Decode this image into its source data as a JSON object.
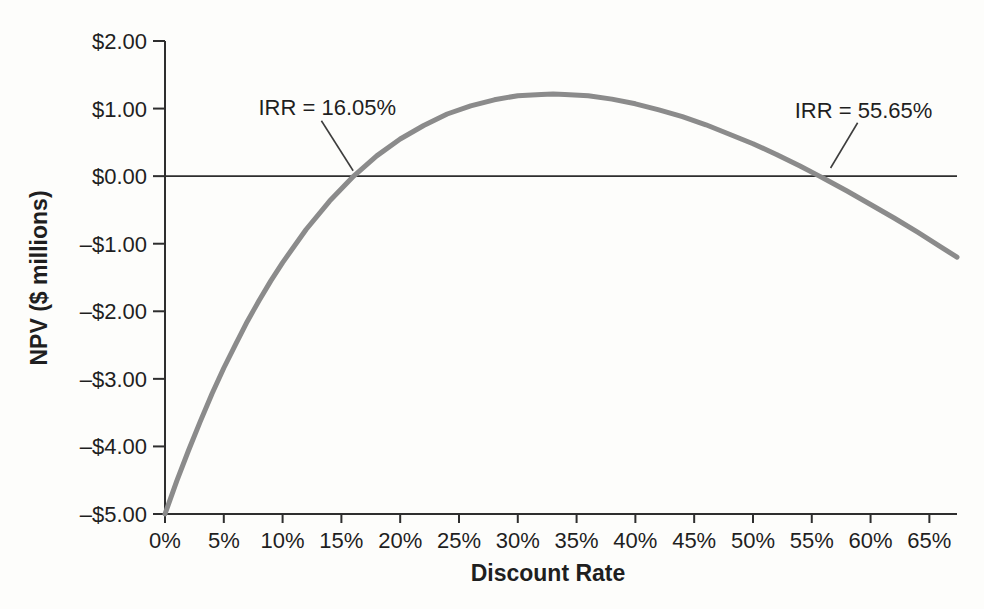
{
  "figure": {
    "background": "#fdfdfb",
    "text_color": "#1f1f1f",
    "axis_color": "#2e2e2e",
    "curve_color": "#8b8b8b",
    "leader_color": "#3d3d3d"
  },
  "chart_data": {
    "type": "line",
    "title": "",
    "xlabel": "Discount Rate",
    "ylabel": "NPV ($ millions)",
    "xlim": [
      0,
      67.35
    ],
    "ylim": [
      -5,
      2
    ],
    "grid": false,
    "legend_position": "none",
    "x_ticks": [
      0,
      5,
      10,
      15,
      20,
      25,
      30,
      35,
      40,
      45,
      50,
      55,
      60,
      65
    ],
    "x_tick_labels": [
      "0%",
      "5%",
      "10%",
      "15%",
      "20%",
      "25%",
      "30%",
      "35%",
      "40%",
      "45%",
      "50%",
      "55%",
      "60%",
      "65%"
    ],
    "y_ticks": [
      2,
      1,
      0,
      -1,
      -2,
      -3,
      -4,
      -5
    ],
    "y_tick_labels": [
      "$2.00",
      "$1.00",
      "$0.00",
      "–$1.00",
      "–$2.00",
      "–$3.00",
      "–$4.00",
      "–$5.00"
    ],
    "ref_line_y": 0,
    "series": [
      {
        "name": "NPV profile",
        "x": [
          0,
          1,
          2,
          3,
          4,
          5,
          6,
          7,
          8,
          9,
          10,
          12,
          14,
          16.05,
          18,
          20,
          22,
          24,
          26,
          28,
          30,
          32,
          33,
          34,
          36,
          38,
          40,
          42,
          44,
          46,
          48,
          50,
          52,
          54,
          55.65,
          56,
          58,
          60,
          62,
          64,
          66,
          67.35
        ],
        "y": [
          -5.0,
          -4.51,
          -4.06,
          -3.63,
          -3.22,
          -2.84,
          -2.49,
          -2.15,
          -1.84,
          -1.55,
          -1.28,
          -0.79,
          -0.37,
          0,
          0.3,
          0.55,
          0.75,
          0.92,
          1.04,
          1.13,
          1.19,
          1.21,
          1.215,
          1.21,
          1.19,
          1.14,
          1.07,
          0.98,
          0.88,
          0.76,
          0.62,
          0.48,
          0.32,
          0.15,
          0,
          -0.03,
          -0.22,
          -0.42,
          -0.62,
          -0.83,
          -1.05,
          -1.2
        ]
      }
    ],
    "irr_values": [
      16.05,
      55.65
    ],
    "annotations": [
      {
        "text": "IRR = 16.05%",
        "text_x": 13.8,
        "text_y": 1.02,
        "leader": {
          "x1": 13.3,
          "y1": 0.82,
          "x2": 16.0,
          "y2": 0.08
        }
      },
      {
        "text": "IRR = 55.65%",
        "text_x": 59.4,
        "text_y": 0.98,
        "leader": {
          "x1": 58.9,
          "y1": 0.79,
          "x2": 56.6,
          "y2": 0.12
        }
      }
    ]
  }
}
